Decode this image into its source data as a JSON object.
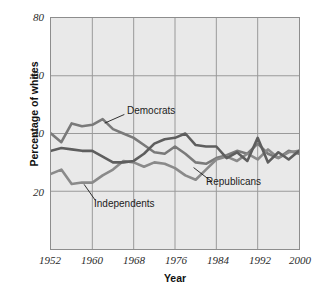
{
  "chart_data": {
    "type": "line",
    "title": "",
    "xlabel": "Year",
    "ylabel": "Percentage of whites",
    "xlim": [
      1952,
      2000
    ],
    "ylim": [
      0,
      80
    ],
    "xticks": [
      1952,
      1960,
      1968,
      1976,
      1984,
      1992,
      2000
    ],
    "yticks": [
      20,
      40,
      60,
      80
    ],
    "grid": true,
    "legend_position": "inline-annotations",
    "x": [
      1952,
      1954,
      1956,
      1958,
      1960,
      1962,
      1964,
      1966,
      1968,
      1970,
      1972,
      1974,
      1976,
      1978,
      1980,
      1982,
      1984,
      1986,
      1988,
      1990,
      1992,
      1994,
      1996,
      1998,
      2000
    ],
    "series": [
      {
        "name": "Democrats",
        "color": "#7a7a7a",
        "values": [
          40.0,
          37.0,
          43.5,
          42.5,
          43.0,
          45.0,
          41.5,
          40.0,
          38.5,
          36.0,
          33.5,
          33.0,
          35.5,
          33.0,
          30.0,
          29.5,
          31.5,
          32.5,
          34.0,
          33.0,
          36.5,
          33.0,
          31.5,
          34.0,
          33.0
        ]
      },
      {
        "name": "Independents",
        "color": "#8a8a8a",
        "values": [
          26.0,
          27.5,
          22.5,
          23.0,
          23.0,
          25.5,
          27.5,
          30.5,
          30.0,
          28.5,
          30.0,
          29.5,
          28.0,
          25.5,
          24.0,
          27.5,
          31.0,
          32.0,
          30.5,
          33.0,
          31.0,
          34.5,
          31.5,
          33.5,
          34.0
        ]
      },
      {
        "name": "Republicans",
        "color": "#5e5e5e",
        "values": [
          34.0,
          35.0,
          34.5,
          34.0,
          34.0,
          32.0,
          30.0,
          30.0,
          30.5,
          33.0,
          36.5,
          38.0,
          38.5,
          40.0,
          36.0,
          35.5,
          35.5,
          31.5,
          33.5,
          30.5,
          38.5,
          30.0,
          33.5,
          31.0,
          34.0
        ]
      }
    ],
    "annotations": [
      {
        "text": "Democrats",
        "x": 1966,
        "y": 48
      },
      {
        "text": "Independents",
        "x": 1960,
        "y": 15
      },
      {
        "text": "Republicans",
        "x": 1983,
        "y": 22
      }
    ]
  },
  "axes": {
    "y_title": "Percentage of whites",
    "x_title": "Year",
    "y_tick_labels": [
      "80",
      "60",
      "40",
      "20"
    ],
    "x_tick_labels": [
      "1952",
      "1960",
      "1968",
      "1976",
      "1984",
      "1992",
      "2000"
    ]
  },
  "labels": {
    "democrats": "Democrats",
    "independents": "Independents",
    "republicans": "Republicans"
  },
  "colors": {
    "background": "#ffffff",
    "plot_background": "#e9e9e9",
    "gridline": "#9a9a9a",
    "frame": "#8d8d8d",
    "democrats": "#7a7a7a",
    "independents": "#8a8a8a",
    "republicans": "#5e5e5e",
    "text": "#1c1c1c"
  }
}
